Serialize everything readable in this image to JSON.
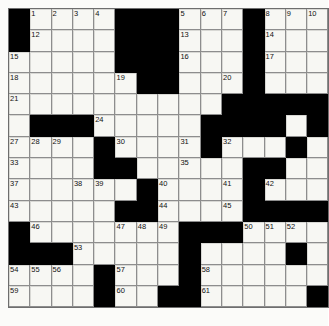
{
  "puzzle": {
    "type": "crossword-grid",
    "columns": 15,
    "rows": 14,
    "cell_size_px": 21.3,
    "colors": {
      "fill": "#f7f7f3",
      "block": "#000000",
      "rule": "#6e6e6e",
      "number": "#111111",
      "page": "#fbfbf9"
    },
    "black_cells": [
      [
        0,
        0
      ],
      [
        0,
        5
      ],
      [
        0,
        6
      ],
      [
        0,
        7
      ],
      [
        0,
        11
      ],
      [
        1,
        0
      ],
      [
        1,
        5
      ],
      [
        1,
        6
      ],
      [
        1,
        7
      ],
      [
        1,
        11
      ],
      [
        2,
        5
      ],
      [
        2,
        6
      ],
      [
        2,
        7
      ],
      [
        2,
        11
      ],
      [
        3,
        6
      ],
      [
        3,
        7
      ],
      [
        3,
        11
      ],
      [
        4,
        10
      ],
      [
        4,
        11
      ],
      [
        4,
        12
      ],
      [
        4,
        13
      ],
      [
        4,
        14
      ],
      [
        5,
        14
      ],
      [
        6,
        1
      ],
      [
        6,
        2
      ],
      [
        6,
        3
      ],
      [
        6,
        4
      ],
      [
        6,
        9
      ],
      [
        6,
        10
      ],
      [
        6,
        11
      ],
      [
        6,
        12
      ],
      [
        7,
        4
      ],
      [
        7,
        8
      ],
      [
        7,
        9
      ],
      [
        8,
        4
      ],
      [
        8,
        5
      ],
      [
        8,
        11
      ],
      [
        8,
        12
      ],
      [
        9,
        6
      ],
      [
        9,
        9
      ],
      [
        9,
        10
      ],
      [
        10,
        7
      ],
      [
        10,
        12
      ],
      [
        11,
        6
      ],
      [
        11,
        7
      ],
      [
        11,
        8
      ],
      [
        11,
        13
      ],
      [
        11,
        14
      ],
      [
        12,
        0
      ],
      [
        12,
        1
      ],
      [
        12,
        2
      ],
      [
        12,
        3
      ],
      [
        12,
        4
      ],
      [
        12,
        5
      ],
      [
        13,
        5
      ],
      [
        13,
        13
      ]
    ],
    "numbers": [
      {
        "n": 1,
        "r": 0,
        "c": 1
      },
      {
        "n": 2,
        "r": 0,
        "c": 2
      },
      {
        "n": 3,
        "r": 0,
        "c": 3
      },
      {
        "n": 4,
        "r": 0,
        "c": 4
      },
      {
        "n": 5,
        "r": 0,
        "c": 8
      },
      {
        "n": 6,
        "r": 0,
        "c": 9
      },
      {
        "n": 7,
        "r": 0,
        "c": 10
      },
      {
        "n": 8,
        "r": 0,
        "c": 12
      },
      {
        "n": 9,
        "r": 0,
        "c": 13
      },
      {
        "n": 10,
        "r": 0,
        "c": 14
      },
      {
        "n": 11,
        "r": 0,
        "c": 15
      },
      {
        "n": 12,
        "r": 1,
        "c": 1
      },
      {
        "n": 13,
        "r": 1,
        "c": 8
      },
      {
        "n": 14,
        "r": 1,
        "c": 12
      },
      {
        "n": 15,
        "r": 2,
        "c": 0
      },
      {
        "n": 16,
        "r": 2,
        "c": 8
      },
      {
        "n": 17,
        "r": 2,
        "c": 12
      },
      {
        "n": 18,
        "r": 3,
        "c": 0
      },
      {
        "n": 19,
        "r": 3,
        "c": 5
      },
      {
        "n": 20,
        "r": 3,
        "c": 10
      },
      {
        "n": 21,
        "r": 4,
        "c": 0
      },
      {
        "n": 22,
        "r": 4,
        "c": 12
      },
      {
        "n": 23,
        "r": 4,
        "c": 13
      },
      {
        "n": 24,
        "r": 5,
        "c": 4
      },
      {
        "n": 25,
        "r": 5,
        "c": 11
      },
      {
        "n": 26,
        "r": 5,
        "c": 14
      },
      {
        "n": 27,
        "r": 6,
        "c": 0
      },
      {
        "n": 28,
        "r": 6,
        "c": 1
      },
      {
        "n": 29,
        "r": 6,
        "c": 2
      },
      {
        "n": 30,
        "r": 6,
        "c": 5
      },
      {
        "n": 31,
        "r": 6,
        "c": 8
      },
      {
        "n": 32,
        "r": 6,
        "c": 10
      },
      {
        "n": 33,
        "r": 7,
        "c": 0
      },
      {
        "n": 34,
        "r": 7,
        "c": 5
      },
      {
        "n": 35,
        "r": 7,
        "c": 8
      },
      {
        "n": 36,
        "r": 7,
        "c": 12
      },
      {
        "n": 37,
        "r": 8,
        "c": 0
      },
      {
        "n": 38,
        "r": 8,
        "c": 3
      },
      {
        "n": 39,
        "r": 8,
        "c": 4
      },
      {
        "n": 40,
        "r": 8,
        "c": 7
      },
      {
        "n": 41,
        "r": 8,
        "c": 10
      },
      {
        "n": 42,
        "r": 8,
        "c": 12
      },
      {
        "n": 43,
        "r": 9,
        "c": 0
      },
      {
        "n": 44,
        "r": 9,
        "c": 7
      },
      {
        "n": 45,
        "r": 9,
        "c": 10
      },
      {
        "n": 46,
        "r": 10,
        "c": 1
      },
      {
        "n": 47,
        "r": 10,
        "c": 5
      },
      {
        "n": 48,
        "r": 10,
        "c": 6
      },
      {
        "n": 49,
        "r": 10,
        "c": 7
      },
      {
        "n": 50,
        "r": 10,
        "c": 11
      },
      {
        "n": 51,
        "r": 10,
        "c": 12
      },
      {
        "n": 52,
        "r": 10,
        "c": 13
      },
      {
        "n": 53,
        "r": 11,
        "c": 3
      },
      {
        "n": 54,
        "r": 12,
        "c": 0
      },
      {
        "n": 55,
        "r": 12,
        "c": 1
      },
      {
        "n": 56,
        "r": 12,
        "c": 2
      },
      {
        "n": 57,
        "r": 12,
        "c": 5
      },
      {
        "n": 58,
        "r": 12,
        "c": 9
      },
      {
        "n": 59,
        "r": 13,
        "c": 0
      },
      {
        "n": 60,
        "r": 13,
        "c": 5
      },
      {
        "n": 61,
        "r": 13,
        "c": 9
      },
      {
        "n": 62,
        "r": 14,
        "c": 0
      },
      {
        "n": 63,
        "r": 14,
        "c": 5
      },
      {
        "n": 64,
        "r": 14,
        "c": 9
      }
    ]
  }
}
